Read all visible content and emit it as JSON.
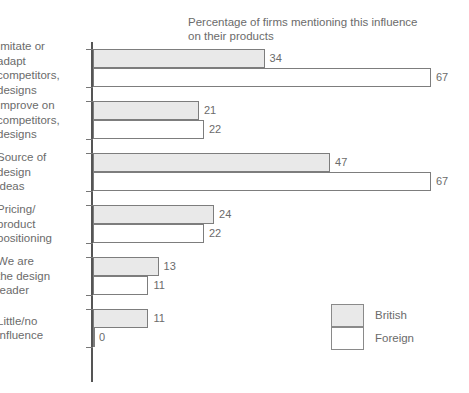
{
  "chart_data": {
    "type": "bar",
    "orientation": "horizontal",
    "title": "Percentage of firms mentioning this influence\non their products",
    "xlabel": "",
    "ylabel": "",
    "xlim": [
      0,
      67
    ],
    "grid": false,
    "legend_position": "bottom-right",
    "categories": [
      "Imitate or\nadapt\ncompetitors,\ndesigns",
      "Improve on\ncompetitors,\ndesigns",
      "Source of\ndesign\nideas",
      "Pricing/\nproduct\npositioning",
      "We are\nthe design\nleader",
      "Little/no\ninfluence"
    ],
    "series": [
      {
        "name": "British",
        "color": "#e9e9e9",
        "values": [
          34,
          21,
          47,
          24,
          13,
          11
        ]
      },
      {
        "name": "Foreign",
        "color": "#ffffff",
        "values": [
          67,
          22,
          67,
          22,
          11,
          0
        ]
      }
    ]
  },
  "legend": {
    "items": [
      {
        "label": "British",
        "swatch": "british"
      },
      {
        "label": "Foreign",
        "swatch": "foreign"
      }
    ]
  }
}
